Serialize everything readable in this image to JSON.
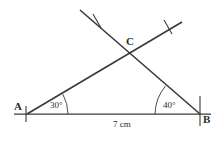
{
  "figure": {
    "stroke_color": "#3a3a3a",
    "background_color": "#ffffff",
    "vertices": {
      "A": {
        "label": "A",
        "x": 27,
        "y": 114
      },
      "B": {
        "label": "B",
        "x": 200,
        "y": 114
      },
      "C": {
        "label": "C",
        "x": 131,
        "y": 52
      }
    },
    "angles": {
      "at_A": {
        "label": "30°",
        "value": 30,
        "unit": "degrees"
      },
      "at_B": {
        "label": "40°",
        "value": 40,
        "unit": "degrees"
      }
    },
    "sides": {
      "AB": {
        "label": "7 cm",
        "value": 7,
        "unit": "cm"
      }
    },
    "marks": {
      "tick_left_ray": "tick-mark",
      "tick_right_ray": "tick-mark",
      "tick_vertex_A": "tick-mark",
      "tick_vertex_B": "tick-mark"
    }
  }
}
